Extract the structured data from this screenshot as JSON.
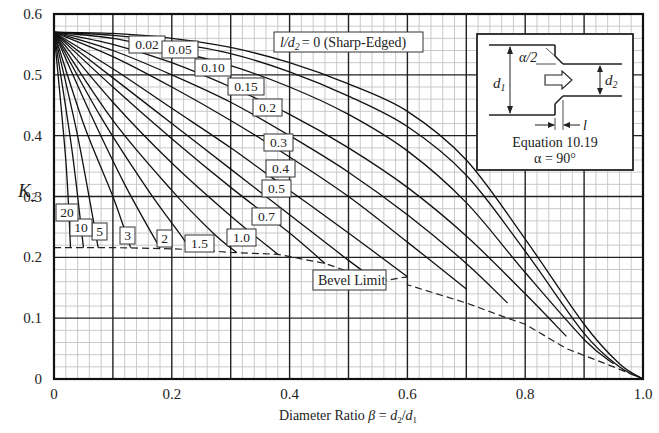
{
  "chart_data": {
    "type": "line",
    "title": "",
    "xlabel": "Diameter Ratio β = d2/d1",
    "xlabel_parts": {
      "prefix": "Diameter Ratio ",
      "beta": "β",
      "eq": " = ",
      "d2": "d",
      "d2sub": "2",
      "slash": "/",
      "d1": "d",
      "d1sub": "1"
    },
    "ylabel": "K2",
    "ylabel_parts": {
      "k": "K",
      "sub": "2"
    },
    "xlim": [
      0,
      1.0
    ],
    "ylim": [
      0,
      0.6
    ],
    "grid": true,
    "x_ticks": [
      "0",
      "0.2",
      "0.4",
      "0.6",
      "0.8",
      "1.0"
    ],
    "y_ticks": [
      "0",
      "0.1",
      "0.2",
      "0.3",
      "0.4",
      "0.5",
      "0.6"
    ],
    "series_param": "l/d2",
    "series": [
      {
        "name": "0 (Sharp-Edged)",
        "label": "l/d2 = 0 (Sharp-Edged)",
        "ld": 0,
        "points": [
          [
            0,
            0.57
          ],
          [
            0.1,
            0.568
          ],
          [
            0.2,
            0.56
          ],
          [
            0.3,
            0.545
          ],
          [
            0.4,
            0.52
          ],
          [
            0.5,
            0.485
          ],
          [
            0.6,
            0.44
          ],
          [
            0.7,
            0.36
          ],
          [
            0.8,
            0.23
          ],
          [
            0.9,
            0.09
          ],
          [
            0.96,
            0.025
          ],
          [
            1.0,
            0
          ]
        ]
      },
      {
        "name": "0.02",
        "ld": 0.02,
        "points": [
          [
            0,
            0.57
          ],
          [
            0.1,
            0.565
          ],
          [
            0.2,
            0.553
          ],
          [
            0.3,
            0.535
          ],
          [
            0.4,
            0.505
          ],
          [
            0.5,
            0.465
          ],
          [
            0.6,
            0.415
          ],
          [
            0.7,
            0.335
          ],
          [
            0.8,
            0.21
          ],
          [
            0.9,
            0.075
          ],
          [
            0.96,
            0.02
          ],
          [
            1.0,
            0
          ]
        ]
      },
      {
        "name": "0.05",
        "ld": 0.05,
        "points": [
          [
            0,
            0.57
          ],
          [
            0.1,
            0.56
          ],
          [
            0.2,
            0.54
          ],
          [
            0.3,
            0.515
          ],
          [
            0.4,
            0.48
          ],
          [
            0.5,
            0.435
          ],
          [
            0.6,
            0.375
          ],
          [
            0.7,
            0.29
          ],
          [
            0.8,
            0.175
          ],
          [
            0.9,
            0.065
          ],
          [
            0.95,
            0.025
          ]
        ]
      },
      {
        "name": "0.10",
        "ld": 0.1,
        "points": [
          [
            0,
            0.57
          ],
          [
            0.1,
            0.55
          ],
          [
            0.2,
            0.52
          ],
          [
            0.3,
            0.48
          ],
          [
            0.4,
            0.435
          ],
          [
            0.5,
            0.38
          ],
          [
            0.6,
            0.315
          ],
          [
            0.7,
            0.235
          ],
          [
            0.8,
            0.14
          ],
          [
            0.87,
            0.07
          ]
        ]
      },
      {
        "name": "0.15",
        "ld": 0.15,
        "points": [
          [
            0,
            0.57
          ],
          [
            0.1,
            0.54
          ],
          [
            0.2,
            0.5
          ],
          [
            0.3,
            0.455
          ],
          [
            0.4,
            0.4
          ],
          [
            0.5,
            0.34
          ],
          [
            0.6,
            0.27
          ],
          [
            0.7,
            0.19
          ],
          [
            0.77,
            0.125
          ]
        ]
      },
      {
        "name": "0.2",
        "ld": 0.2,
        "points": [
          [
            0,
            0.57
          ],
          [
            0.1,
            0.53
          ],
          [
            0.2,
            0.48
          ],
          [
            0.3,
            0.425
          ],
          [
            0.4,
            0.365
          ],
          [
            0.5,
            0.3
          ],
          [
            0.6,
            0.225
          ],
          [
            0.7,
            0.148
          ]
        ]
      },
      {
        "name": "0.3",
        "ld": 0.3,
        "points": [
          [
            0,
            0.57
          ],
          [
            0.1,
            0.51
          ],
          [
            0.2,
            0.445
          ],
          [
            0.3,
            0.38
          ],
          [
            0.4,
            0.31
          ],
          [
            0.5,
            0.24
          ],
          [
            0.6,
            0.168
          ]
        ]
      },
      {
        "name": "0.4",
        "ld": 0.4,
        "points": [
          [
            0,
            0.57
          ],
          [
            0.1,
            0.495
          ],
          [
            0.2,
            0.42
          ],
          [
            0.3,
            0.345
          ],
          [
            0.4,
            0.27
          ],
          [
            0.5,
            0.195
          ],
          [
            0.55,
            0.16
          ]
        ]
      },
      {
        "name": "0.5",
        "ld": 0.5,
        "points": [
          [
            0,
            0.57
          ],
          [
            0.1,
            0.48
          ],
          [
            0.2,
            0.395
          ],
          [
            0.3,
            0.315
          ],
          [
            0.4,
            0.24
          ],
          [
            0.46,
            0.19
          ]
        ]
      },
      {
        "name": "0.7",
        "ld": 0.7,
        "points": [
          [
            0,
            0.57
          ],
          [
            0.1,
            0.455
          ],
          [
            0.2,
            0.355
          ],
          [
            0.3,
            0.268
          ],
          [
            0.38,
            0.205
          ]
        ]
      },
      {
        "name": "1.0",
        "ld": 1.0,
        "points": [
          [
            0,
            0.57
          ],
          [
            0.1,
            0.425
          ],
          [
            0.2,
            0.31
          ],
          [
            0.27,
            0.24
          ],
          [
            0.31,
            0.208
          ]
        ]
      },
      {
        "name": "1.5",
        "ld": 1.5,
        "points": [
          [
            0,
            0.57
          ],
          [
            0.08,
            0.43
          ],
          [
            0.16,
            0.31
          ],
          [
            0.22,
            0.23
          ],
          [
            0.23,
            0.212
          ]
        ]
      },
      {
        "name": "2",
        "ld": 2,
        "points": [
          [
            0,
            0.57
          ],
          [
            0.06,
            0.44
          ],
          [
            0.12,
            0.32
          ],
          [
            0.18,
            0.215
          ]
        ]
      },
      {
        "name": "3",
        "ld": 3,
        "points": [
          [
            0,
            0.57
          ],
          [
            0.05,
            0.42
          ],
          [
            0.1,
            0.3
          ],
          [
            0.13,
            0.216
          ]
        ]
      },
      {
        "name": "5",
        "ld": 5,
        "points": [
          [
            0,
            0.57
          ],
          [
            0.04,
            0.4
          ],
          [
            0.075,
            0.216
          ]
        ]
      },
      {
        "name": "10",
        "ld": 10,
        "points": [
          [
            0,
            0.57
          ],
          [
            0.03,
            0.38
          ],
          [
            0.05,
            0.216
          ]
        ]
      },
      {
        "name": "20",
        "ld": 20,
        "points": [
          [
            0,
            0.57
          ],
          [
            0.02,
            0.36
          ],
          [
            0.028,
            0.216
          ]
        ]
      }
    ],
    "bevel_limit": {
      "name": "Bevel Limit",
      "points": [
        [
          0,
          0.216
        ],
        [
          0.1,
          0.216
        ],
        [
          0.2,
          0.214
        ],
        [
          0.25,
          0.212
        ],
        [
          0.3,
          0.208
        ],
        [
          0.38,
          0.205
        ],
        [
          0.46,
          0.19
        ],
        [
          0.55,
          0.16
        ],
        [
          0.6,
          0.168
        ],
        [
          0.6,
          0.155
        ],
        [
          0.7,
          0.125
        ],
        [
          0.77,
          0.1
        ],
        [
          0.8,
          0.09
        ],
        [
          0.87,
          0.05
        ],
        [
          0.95,
          0.02
        ],
        [
          1.0,
          0
        ]
      ]
    },
    "annotations": [
      {
        "text": "Bevel Limit",
        "x": 0.5,
        "y": 0.19
      },
      {
        "text": "l/d2 = 0 (Sharp-Edged)",
        "x": 0.39,
        "y": 0.556
      }
    ],
    "inset": {
      "labels": {
        "alpha_half": "α/2",
        "d1": "d",
        "d1_sub": "1",
        "d2": "d",
        "d2_sub": "2",
        "l": "l",
        "equation": "Equation 10.19",
        "alpha_eq": "α = 90°"
      }
    }
  },
  "labels": {
    "sharp_edged": "= 0 (Sharp-Edged)",
    "sharp_l": "l/d",
    "sharp_sub": "2",
    "bevel": "Bevel Limit"
  }
}
